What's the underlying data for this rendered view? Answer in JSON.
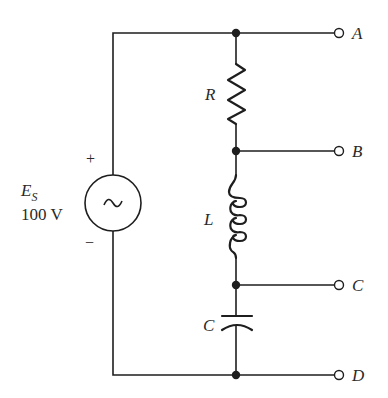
{
  "diagram": {
    "type": "series RLC circuit with AC source",
    "source": {
      "symbol": "E",
      "subscript": "S",
      "value": "100 V",
      "plus": "+",
      "minus": "−",
      "glyph": "~"
    },
    "components": {
      "resistor": "R",
      "inductor": "L",
      "capacitor": "C"
    },
    "terminals": {
      "a": "A",
      "b": "B",
      "c": "C",
      "d": "D"
    },
    "colors": {
      "line": "#1e1e1e",
      "background": "#ffffff"
    }
  }
}
